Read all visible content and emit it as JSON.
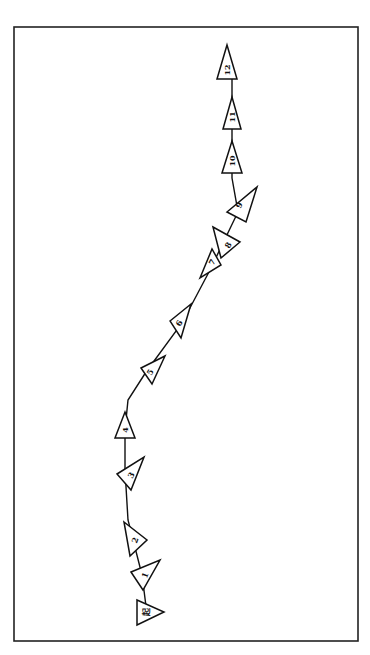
{
  "diagram": {
    "type": "traverse-path",
    "frame": {
      "x": 14,
      "y": 27,
      "w": 344,
      "h": 614,
      "stroke": "#222222"
    },
    "colors": {
      "line": "#111111",
      "fill": "#ffffff"
    },
    "path": [
      [
        147,
        614
      ],
      [
        142,
        575
      ],
      [
        128,
        520
      ],
      [
        125,
        470
      ],
      [
        125,
        430
      ],
      [
        128,
        400
      ],
      [
        146,
        372
      ],
      [
        182,
        323
      ],
      [
        210,
        270
      ],
      [
        238,
        212
      ],
      [
        232,
        178
      ],
      [
        232,
        143
      ],
      [
        232,
        105
      ],
      [
        232,
        74
      ]
    ],
    "stations": [
      {
        "label": "起",
        "cx": 146,
        "cy": 612,
        "points": "137,600 164,612 137,625",
        "rot": -90
      },
      {
        "label": "1",
        "cx": 145,
        "cy": 575,
        "points": "131,572 160,560 143,590",
        "rot": -70
      },
      {
        "label": "2",
        "cx": 135,
        "cy": 540,
        "points": "124,522 147,540 130,556",
        "rot": -70
      },
      {
        "label": "3",
        "cx": 131,
        "cy": 475,
        "points": "117,474 144,457 131,490",
        "rot": -60
      },
      {
        "label": "4",
        "cx": 125,
        "cy": 430,
        "points": "125,412 135,438 115,438",
        "rot": -90
      },
      {
        "label": "5",
        "cx": 150,
        "cy": 372,
        "points": "141,368 165,356 152,384",
        "rot": -60
      },
      {
        "label": "6",
        "cx": 179,
        "cy": 323,
        "points": "170,321 191,304 181,338",
        "rot": -60
      },
      {
        "label": "7",
        "cx": 212,
        "cy": 262,
        "points": "200,278 212,249 221,265",
        "rot": -60
      },
      {
        "label": "8",
        "cx": 228,
        "cy": 245,
        "points": "213,227 240,242 221,258",
        "rot": -60
      },
      {
        "label": "9",
        "cx": 239,
        "cy": 205,
        "points": "227,212 257,187 246,222",
        "rot": -60
      },
      {
        "label": "10",
        "cx": 232,
        "cy": 161,
        "points": "232,141 242,173 222,173",
        "rot": -90
      },
      {
        "label": "11",
        "cx": 232,
        "cy": 117,
        "points": "232,97 241,129 223,129",
        "rot": -90
      },
      {
        "label": "12",
        "cx": 227,
        "cy": 70,
        "points": "227,45 237,79 217,79",
        "rot": -90
      }
    ]
  }
}
